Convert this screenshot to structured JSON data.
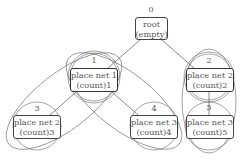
{
  "diagram": {
    "nodes": [
      {
        "id": "0",
        "line1": "root",
        "line2": "(empty)"
      },
      {
        "id": "1",
        "line1": "place net 1",
        "line2": "(count)1"
      },
      {
        "id": "2",
        "line1": "place net 2",
        "line2": "(count)2"
      },
      {
        "id": "3",
        "line1": "place net 2",
        "line2": "(count)3"
      },
      {
        "id": "4",
        "line1": "place net 3",
        "line2": "(count)4"
      },
      {
        "id": "5",
        "line1": "place net 3",
        "line2": "(count)5"
      }
    ],
    "edges": [
      [
        "0",
        "1"
      ],
      [
        "0",
        "2"
      ],
      [
        "1",
        "3"
      ],
      [
        "1",
        "4"
      ],
      [
        "2",
        "5"
      ]
    ],
    "colors": {
      "stroke": "#444444",
      "text": "#555555",
      "background": "#ffffff"
    }
  }
}
